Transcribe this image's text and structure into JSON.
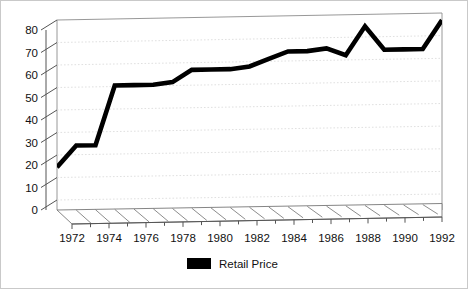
{
  "chart_data": {
    "type": "line",
    "title": "",
    "xlabel": "",
    "ylabel": "",
    "xlim": [
      1972,
      1992
    ],
    "ylim": [
      0,
      80
    ],
    "grid": true,
    "legend_position": "bottom-center",
    "y_ticks": [
      0,
      10,
      20,
      30,
      40,
      50,
      60,
      70,
      80
    ],
    "y_tick_labels": [
      "0",
      "10",
      "20",
      "30",
      "40",
      "50",
      "60",
      "70",
      "80"
    ],
    "x_ticks": [
      1972,
      1974,
      1976,
      1978,
      1980,
      1982,
      1984,
      1986,
      1988,
      1990,
      1992
    ],
    "x_tick_labels": [
      "1972",
      "1974",
      "1976",
      "1978",
      "1980",
      "1982",
      "1984",
      "1986",
      "1988",
      "1990",
      "1992"
    ],
    "x_minor_ticks": [
      1973,
      1975,
      1977,
      1979,
      1981,
      1983,
      1985,
      1987,
      1989,
      1991
    ],
    "series": [
      {
        "name": "Retail Price",
        "color": "#000000",
        "x": [
          1972,
          1973,
          1974,
          1975,
          1976,
          1977,
          1978,
          1979,
          1980,
          1981,
          1982,
          1983,
          1984,
          1985,
          1986,
          1987,
          1988,
          1989,
          1990,
          1991,
          1992
        ],
        "values": [
          18,
          27,
          27,
          52,
          52,
          52,
          53,
          58,
          58,
          58,
          59,
          62,
          65,
          65,
          66,
          63,
          75,
          65,
          65,
          65,
          77
        ]
      }
    ]
  },
  "legend": {
    "entries": [
      {
        "label": "Retail Price",
        "color": "#000000"
      }
    ]
  },
  "axes": {
    "y_title": "",
    "x_title": ""
  }
}
